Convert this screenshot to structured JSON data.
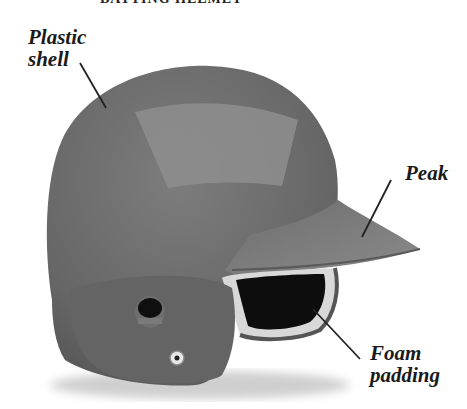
{
  "diagram": {
    "title": "BATTING HELMET",
    "labels": [
      {
        "id": "plastic-shell",
        "text": "Plastic\nshell"
      },
      {
        "id": "peak",
        "text": "Peak"
      },
      {
        "id": "foam-padding",
        "text": "Foam\npadding"
      }
    ],
    "colors": {
      "shell": "#6a6a6a",
      "shell_highlight": "#8e8e8e",
      "peak": "#7c7c7c",
      "padding_interior": "#0d0d0d",
      "padding_rim": "#d8d8d8",
      "leader_line": "#222222",
      "text": "#1a1a1a"
    }
  }
}
